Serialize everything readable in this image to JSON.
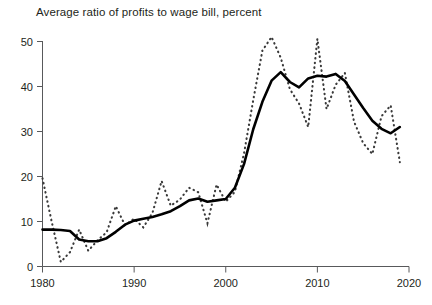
{
  "chart_data": {
    "type": "line",
    "title": "Average ratio of profits to wage bill, percent",
    "xlabel": "",
    "ylabel": "",
    "xlim": [
      1980,
      2020
    ],
    "ylim": [
      0,
      52
    ],
    "grid": false,
    "legend": "none",
    "x_ticks": [
      "1980",
      "1990",
      "2000",
      "2010",
      "2020"
    ],
    "x_tick_values": [
      1980,
      1990,
      2000,
      2010,
      2020
    ],
    "y_ticks": [
      "0",
      "10",
      "20",
      "30",
      "40",
      "50"
    ],
    "y_tick_values": [
      0,
      10,
      20,
      30,
      40,
      50
    ],
    "x": [
      1980,
      1981,
      1982,
      1983,
      1984,
      1985,
      1986,
      1987,
      1988,
      1989,
      1990,
      1991,
      1992,
      1993,
      1994,
      1995,
      1996,
      1997,
      1998,
      1999,
      2000,
      2001,
      2002,
      2003,
      2004,
      2005,
      2006,
      2007,
      2008,
      2009,
      2010,
      2011,
      2012,
      2013,
      2014,
      2015,
      2016,
      2017,
      2018,
      2019
    ],
    "series": [
      {
        "name": "smoothed-trend",
        "style": "solid",
        "values": [
          8.2,
          8.2,
          8.1,
          7.9,
          6.0,
          5.6,
          5.6,
          6.3,
          7.7,
          9.3,
          10.2,
          10.6,
          11.0,
          11.6,
          12.3,
          13.4,
          14.7,
          15.1,
          14.4,
          14.7,
          15.0,
          17.5,
          22.8,
          30.5,
          36.6,
          41.3,
          43.2,
          41.0,
          39.8,
          41.8,
          42.4,
          42.2,
          42.8,
          41.2,
          38.2,
          35.2,
          32.4,
          30.6,
          29.6,
          31.0
        ]
      },
      {
        "name": "annual-series",
        "style": "dotted",
        "values": [
          19.6,
          10.0,
          1.0,
          3.2,
          8.2,
          3.5,
          5.8,
          7.6,
          13.4,
          9.2,
          10.6,
          8.7,
          11.9,
          19.0,
          13.5,
          14.9,
          17.5,
          16.5,
          9.6,
          18.2,
          14.4,
          16.6,
          25.2,
          37.0,
          48.0,
          51.0,
          46.4,
          39.4,
          36.2,
          31.0,
          50.6,
          35.0,
          40.4,
          43.0,
          32.2,
          27.4,
          25.0,
          33.4,
          35.8,
          23.2
        ]
      }
    ],
    "annotations": []
  }
}
